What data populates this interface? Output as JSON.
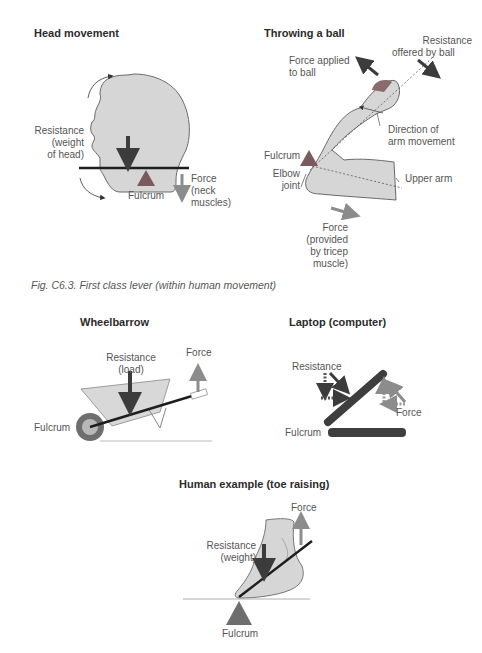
{
  "colors": {
    "skin_fill": "#d6d6d6",
    "outline": "#6a6a6a",
    "lever": "#1e1e1e",
    "resistance_arrow": "#3c3c3c",
    "force_arrow": "#8c8c8c",
    "fulcrum": "#6e6e6e",
    "fulcrum_red": "#7a5a5a",
    "laptop": "#3e3e3e"
  },
  "figure1": {
    "caption": "Fig. C6.3.    First class lever (within human movement)",
    "head": {
      "title": "Head movement",
      "resistance_label": [
        "Resistance",
        "(weight",
        "of head)"
      ],
      "fulcrum_label": "Fulcrum",
      "force_label": [
        "Force",
        "(neck",
        "muscles)"
      ]
    },
    "throw": {
      "title": "Throwing a ball",
      "force_label": [
        "Force applied",
        "to ball"
      ],
      "resistance_label": [
        "Resistance",
        "offered by ball"
      ],
      "direction_label": [
        "Direction of",
        "arm movement"
      ],
      "fulcrum_label": "Fulcrum",
      "elbow_label": [
        "Elbow",
        "joint"
      ],
      "upper_arm_label": "Upper arm",
      "tricep_label": [
        "Force",
        "(provided",
        "by tricep",
        "muscle)"
      ]
    }
  },
  "figure2": {
    "wheelbarrow": {
      "title": "Wheelbarrow",
      "resistance_label": [
        "Resistance",
        "(load)"
      ],
      "force_label": "Force",
      "fulcrum_label": "Fulcrum"
    },
    "laptop": {
      "title": "Laptop (computer)",
      "resistance_label": "Resistance",
      "force_label": "Force",
      "fulcrum_label": "Fulcrum"
    },
    "toe": {
      "title": "Human example (toe raising)",
      "force_label": "Force",
      "resistance_label": [
        "Resistance",
        "(weight)"
      ],
      "fulcrum_label": "Fulcrum"
    }
  }
}
